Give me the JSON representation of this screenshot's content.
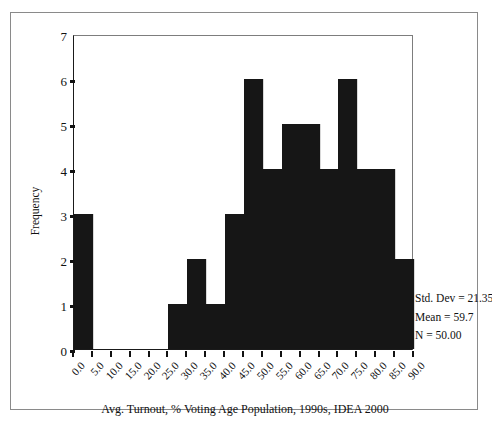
{
  "chart_data": {
    "type": "bar",
    "title": "",
    "xlabel": "Avg. Turnout, % Voting Age Population, 1990s, IDEA 2000",
    "ylabel": "Frequency",
    "xlim": [
      0,
      90
    ],
    "ylim": [
      0,
      7
    ],
    "grid": false,
    "legend": "none",
    "bin_width": 5,
    "x_tick_labels": [
      "0.0",
      "5.0",
      "10.0",
      "15.0",
      "20.0",
      "25.0",
      "30.0",
      "35.0",
      "40.0",
      "45.0",
      "50.0",
      "55.0",
      "60.0",
      "65.0",
      "70.0",
      "75.0",
      "80.0",
      "85.0",
      "90.0"
    ],
    "x_tick_values": [
      0,
      5,
      10,
      15,
      20,
      25,
      30,
      35,
      40,
      45,
      50,
      55,
      60,
      65,
      70,
      75,
      80,
      85,
      90
    ],
    "y_tick_labels": [
      "0",
      "1",
      "2",
      "3",
      "4",
      "5",
      "6",
      "7"
    ],
    "y_tick_values": [
      0,
      1,
      2,
      3,
      4,
      5,
      6,
      7
    ],
    "categories": [
      "0-5",
      "5-10",
      "10-15",
      "15-20",
      "20-25",
      "25-30",
      "30-35",
      "35-40",
      "40-45",
      "45-50",
      "50-55",
      "55-60",
      "60-65",
      "65-70",
      "70-75",
      "75-80",
      "80-85",
      "85-90"
    ],
    "bin_starts": [
      0,
      5,
      10,
      15,
      20,
      25,
      30,
      35,
      40,
      45,
      50,
      55,
      60,
      65,
      70,
      75,
      80,
      85
    ],
    "values": [
      3,
      0,
      0,
      0,
      0,
      1,
      2,
      1,
      3,
      6,
      4,
      5,
      5,
      4,
      6,
      4,
      4,
      2
    ],
    "bar_color": "#161616"
  },
  "stats": {
    "std_dev": "Std. Dev = 21.35",
    "mean": "Mean = 59.7",
    "n": "N = 50.00"
  }
}
